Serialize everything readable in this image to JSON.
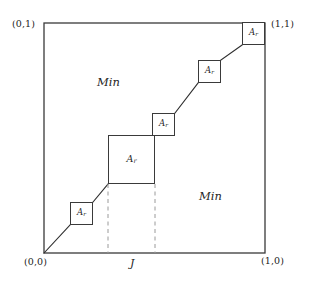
{
  "figure": {
    "title_kind": "unit-square-staircase-diagram",
    "frame": {
      "x": 44,
      "y": 23,
      "width": 221,
      "height": 230,
      "stroke": "#3a3a3a",
      "stroke_width": 1.3
    },
    "corner_labels": [
      {
        "name": "top-left",
        "text": "(0,1)",
        "x": 12,
        "y": 19
      },
      {
        "name": "top-right",
        "text": "(1,1)",
        "x": 271,
        "y": 19
      },
      {
        "name": "bottom-left",
        "text": "(0,0)",
        "x": 24,
        "y": 257
      },
      {
        "name": "bottom-right",
        "text": "(1,0)",
        "x": 261,
        "y": 256
      }
    ],
    "region_labels": [
      {
        "name": "min-upper",
        "text": "Min",
        "x": 97,
        "y": 77
      },
      {
        "name": "min-lower",
        "text": "Min",
        "x": 199,
        "y": 191
      }
    ],
    "axis_labels": [
      {
        "name": "j-tick-label",
        "text": "J",
        "x": 130,
        "y": 258
      }
    ],
    "ar_boxes": [
      {
        "name": "ar-box-1",
        "label": "Ar",
        "sub": "r",
        "base": "A",
        "x": 70,
        "y": 202,
        "w": 23,
        "h": 23,
        "large": false
      },
      {
        "name": "ar-box-2",
        "label": "Ar",
        "sub": "r",
        "base": "A",
        "x": 108,
        "y": 135,
        "w": 47,
        "h": 49,
        "large": true
      },
      {
        "name": "ar-box-3",
        "label": "Ar",
        "sub": "r",
        "base": "A",
        "x": 152,
        "y": 113,
        "w": 23,
        "h": 23,
        "large": false
      },
      {
        "name": "ar-box-4",
        "label": "Ar",
        "sub": "r",
        "base": "A",
        "x": 198,
        "y": 60,
        "w": 23,
        "h": 23,
        "large": false
      },
      {
        "name": "ar-box-5",
        "label": "Ar",
        "sub": "r",
        "base": "A",
        "x": 242,
        "y": 22,
        "w": 23,
        "h": 23,
        "large": false
      }
    ],
    "diagonal_segments": [
      {
        "name": "segment-origin-to-box1",
        "x1": 44,
        "y1": 253,
        "x2": 70,
        "y2": 225
      },
      {
        "name": "segment-box1-to-square",
        "x1": 93,
        "y1": 202,
        "x2": 108,
        "y2": 184
      },
      {
        "name": "segment-square-to-box3",
        "x1": 155,
        "y1": 135,
        "x2": 152,
        "y2": 136
      },
      {
        "name": "segment-box3-to-box4",
        "x1": 175,
        "y1": 113,
        "x2": 198,
        "y2": 83
      },
      {
        "name": "segment-box4-to-box5",
        "x1": 221,
        "y1": 60,
        "x2": 242,
        "y2": 45
      }
    ],
    "dashed_lines": [
      {
        "name": "dashed-left-j",
        "x1": 108,
        "y1": 184,
        "x2": 108,
        "y2": 253
      },
      {
        "name": "dashed-right-j",
        "x1": 155,
        "y1": 184,
        "x2": 155,
        "y2": 253
      }
    ],
    "colors": {
      "line": "#3a3a3a",
      "dashed": "#8a8a8a",
      "text": "#1f1f1f",
      "background": "#ffffff"
    }
  }
}
